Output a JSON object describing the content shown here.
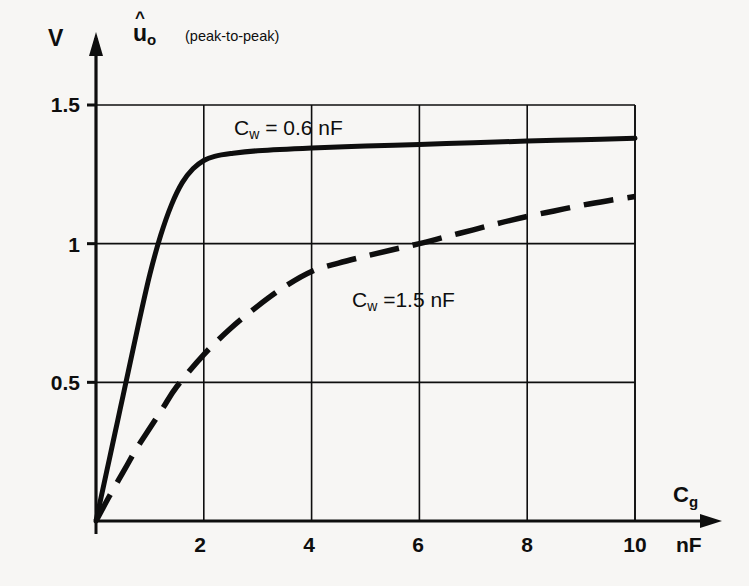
{
  "figure": {
    "y_unit": "V",
    "y_quantity_base": "u",
    "y_quantity_caret": "^",
    "y_quantity_sub": "o",
    "y_quantity_note": "(peak-to-peak)",
    "x_quantity_base": "C",
    "x_quantity_sub": "g",
    "x_unit": "nF"
  },
  "chart_data": {
    "type": "line",
    "title": "",
    "subtitle": "",
    "xlabel": "Cg",
    "ylabel": "uo (peak-to-peak)",
    "x_unit": "nF",
    "y_unit": "V",
    "xlim": [
      0,
      10
    ],
    "ylim": [
      0,
      1.5
    ],
    "xticks": [
      2,
      4,
      6,
      8,
      10
    ],
    "xtick_labels": [
      "2",
      "4",
      "6",
      "8",
      "10"
    ],
    "yticks": [
      0.5,
      1,
      1.5
    ],
    "ytick_labels": [
      "0.5",
      "1",
      "1.5"
    ],
    "grid": true,
    "grid_style": "solid-thin",
    "legend": "inline-annotations",
    "annotations": [
      {
        "text": "Cw = 0.6 nF",
        "x": 3.2,
        "y": 1.43
      },
      {
        "text": "Cw =1.5 nF",
        "x": 5.9,
        "y": 0.82
      }
    ],
    "series": [
      {
        "name": "Cw = 0.6 nF",
        "label_base": "C",
        "label_sub": "w",
        "label_value": "= 0.6 nF",
        "style": "solid",
        "color": "#0e0e0e",
        "x": [
          0,
          0.1,
          0.2,
          0.3,
          0.4,
          0.5,
          0.6,
          0.8,
          1.0,
          1.2,
          1.4,
          1.6,
          1.8,
          2.0,
          2.2,
          2.5,
          3.0,
          4.0,
          5.0,
          6.0,
          7.0,
          8.0,
          9.0,
          10.0
        ],
        "y": [
          0,
          0.09,
          0.18,
          0.27,
          0.36,
          0.45,
          0.54,
          0.72,
          0.89,
          1.03,
          1.14,
          1.22,
          1.27,
          1.3,
          1.315,
          1.325,
          1.335,
          1.345,
          1.352,
          1.358,
          1.364,
          1.37,
          1.375,
          1.38
        ]
      },
      {
        "name": "Cw =1.5 nF",
        "label_base": "C",
        "label_sub": "w",
        "label_value": "=1.5 nF",
        "style": "dashed",
        "color": "#0e0e0e",
        "x": [
          0,
          0.25,
          0.5,
          0.75,
          1.0,
          1.25,
          1.5,
          2.0,
          2.5,
          3.0,
          3.5,
          4.0,
          4.5,
          5.0,
          5.5,
          6.0,
          6.5,
          7.0,
          7.5,
          8.0,
          8.5,
          9.0,
          9.5,
          10.0
        ],
        "y": [
          0,
          0.09,
          0.175,
          0.26,
          0.335,
          0.41,
          0.485,
          0.6,
          0.695,
          0.775,
          0.845,
          0.9,
          0.93,
          0.955,
          0.978,
          1.0,
          1.025,
          1.05,
          1.075,
          1.098,
          1.118,
          1.138,
          1.155,
          1.17
        ]
      }
    ]
  }
}
